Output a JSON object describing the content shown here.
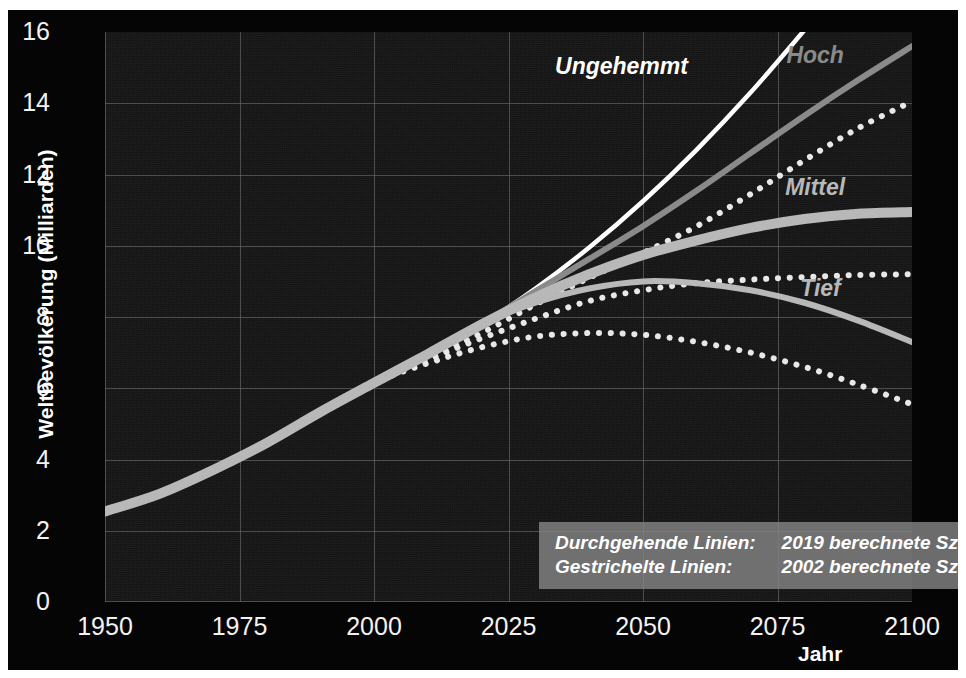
{
  "axes": {
    "y_label": "Weltbevölkerung (Milliarden)",
    "x_label": "Jahr",
    "y_ticks": [
      "16",
      "14",
      "12",
      "10",
      "8",
      "6",
      "4",
      "2",
      "0"
    ],
    "x_ticks": [
      "1950",
      "1975",
      "2000",
      "2025",
      "2050",
      "2075",
      "2100"
    ]
  },
  "curve_labels": {
    "ungehemmt": "Ungehemmt",
    "hoch": "Hoch",
    "mittel": "Mittel",
    "tief": "Tief"
  },
  "legend": {
    "row1_key": "Durchgehende Linien:",
    "row1_val": "2019 berechnete Szenarien",
    "row2_key": "Gestrichelte Linien:",
    "row2_val": "2002 berechnete Szenarien"
  },
  "colors": {
    "background": "#050505",
    "plot_background": "#141414",
    "gridline": "#6e6e6e",
    "tick_text": "#f2f2f2",
    "ungehemmt": "#ffffff",
    "hoch": "#8a8a8a",
    "mittel": "#b8b8b8",
    "tief": "#b8b8b8",
    "dotted": "#e8e8e8",
    "legend_background": "#848484"
  },
  "chart_data": {
    "type": "line",
    "title": "",
    "xlabel": "Jahr",
    "ylabel": "Weltbevölkerung (Milliarden)",
    "xlim": [
      1950,
      2100
    ],
    "ylim": [
      0,
      16
    ],
    "grid": true,
    "legend_position": "inside-bottom-right",
    "x": [
      1950,
      1960,
      1970,
      1980,
      1990,
      2000,
      2010,
      2020,
      2030,
      2040,
      2050,
      2060,
      2070,
      2080,
      2090,
      2100
    ],
    "series": [
      {
        "name": "Ungehemmt",
        "style": "solid",
        "linewidth": "thin",
        "color": "#ffffff",
        "source_year": 2019,
        "label_x": 2046,
        "label_y": 15.0,
        "values": [
          2.54,
          3.03,
          3.7,
          4.46,
          5.33,
          6.15,
          6.96,
          7.79,
          8.8,
          9.95,
          11.25,
          12.7,
          14.3,
          16.05,
          null,
          null
        ],
        "note": "verlässt den Diagrammbereich bei ca. 2072 (16 Mrd.)"
      },
      {
        "name": "Hoch",
        "style": "solid",
        "linewidth": "medium",
        "color": "#8a8a8a",
        "source_year": 2019,
        "label_x": 2082,
        "label_y": 15.3,
        "values": [
          2.54,
          3.03,
          3.7,
          4.46,
          5.33,
          6.15,
          6.96,
          7.79,
          8.72,
          9.63,
          10.55,
          11.55,
          12.6,
          13.65,
          14.65,
          15.6
        ]
      },
      {
        "name": "Mittel",
        "style": "solid",
        "linewidth": "thick",
        "color": "#b8b8b8",
        "source_year": 2019,
        "label_x": 2082,
        "label_y": 11.6,
        "values": [
          2.54,
          3.03,
          3.7,
          4.46,
          5.33,
          6.15,
          6.96,
          7.79,
          8.55,
          9.2,
          9.74,
          10.15,
          10.5,
          10.75,
          10.9,
          10.95
        ]
      },
      {
        "name": "Tief",
        "style": "solid",
        "linewidth": "medium",
        "color": "#b8b8b8",
        "source_year": 2019,
        "label_x": 2083,
        "label_y": 8.75,
        "values": [
          2.54,
          3.03,
          3.7,
          4.46,
          5.33,
          6.15,
          6.96,
          7.79,
          8.4,
          8.8,
          9.0,
          8.95,
          8.75,
          8.4,
          7.9,
          7.3
        ]
      },
      {
        "name": "Hoch (2002)",
        "style": "dotted",
        "linewidth": "medium",
        "color": "#e8e8e8",
        "source_year": 2002,
        "values": [
          2.54,
          3.03,
          3.7,
          4.46,
          5.33,
          6.15,
          6.85,
          7.55,
          8.35,
          9.1,
          9.8,
          10.55,
          11.45,
          12.4,
          13.3,
          14.05
        ]
      },
      {
        "name": "Mittel (2002)",
        "style": "dotted",
        "linewidth": "medium",
        "color": "#e8e8e8",
        "source_year": 2002,
        "values": [
          2.54,
          3.03,
          3.7,
          4.46,
          5.33,
          6.15,
          6.8,
          7.4,
          7.95,
          8.45,
          8.75,
          8.95,
          9.05,
          9.12,
          9.18,
          9.2
        ]
      },
      {
        "name": "Tief (2002)",
        "style": "dotted",
        "linewidth": "medium",
        "color": "#e8e8e8",
        "source_year": 2002,
        "values": [
          2.54,
          3.03,
          3.7,
          4.46,
          5.33,
          6.15,
          6.7,
          7.15,
          7.45,
          7.55,
          7.5,
          7.3,
          7.0,
          6.6,
          6.1,
          5.55
        ]
      }
    ]
  }
}
